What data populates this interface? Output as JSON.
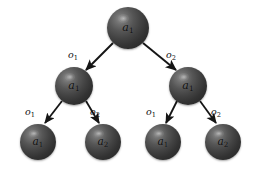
{
  "diagram": {
    "type": "binary-decision-tree",
    "background_color": "#ffffff",
    "node_color": "#3a3a3a",
    "edge_color": "#1a1a1a",
    "label_color": "#111111",
    "levels": 3,
    "nodes": [
      {
        "id": "root",
        "label_main": "a",
        "label_sub": "1",
        "level": 0,
        "cx": 128,
        "cy": 28,
        "r": 21
      },
      {
        "id": "n-l",
        "label_main": "a",
        "label_sub": "1",
        "level": 1,
        "cx": 74,
        "cy": 86,
        "r": 19
      },
      {
        "id": "n-r",
        "label_main": "a",
        "label_sub": "1",
        "level": 1,
        "cx": 188,
        "cy": 86,
        "r": 19
      },
      {
        "id": "leaf-1",
        "label_main": "a",
        "label_sub": "1",
        "level": 2,
        "cx": 38,
        "cy": 142,
        "r": 18
      },
      {
        "id": "leaf-2",
        "label_main": "a",
        "label_sub": "2",
        "level": 2,
        "cx": 103,
        "cy": 142,
        "r": 18
      },
      {
        "id": "leaf-3",
        "label_main": "a",
        "label_sub": "1",
        "level": 2,
        "cx": 163,
        "cy": 142,
        "r": 18
      },
      {
        "id": "leaf-4",
        "label_main": "a",
        "label_sub": "2",
        "level": 2,
        "cx": 223,
        "cy": 142,
        "r": 18
      }
    ],
    "edges": [
      {
        "id": "e-root-l",
        "from": "root",
        "to": "n-l",
        "label_main": "o",
        "label_sub": "1",
        "label_x": 68,
        "label_y": 50
      },
      {
        "id": "e-root-r",
        "from": "root",
        "to": "n-r",
        "label_main": "o",
        "label_sub": "2",
        "label_x": 166,
        "label_y": 50
      },
      {
        "id": "e-l-1",
        "from": "n-l",
        "to": "leaf-1",
        "label_main": "o",
        "label_sub": "1",
        "label_x": 25,
        "label_y": 107
      },
      {
        "id": "e-l-2",
        "from": "n-l",
        "to": "leaf-2",
        "label_main": "o",
        "label_sub": "2",
        "label_x": 90,
        "label_y": 107
      },
      {
        "id": "e-r-1",
        "from": "n-r",
        "to": "leaf-3",
        "label_main": "o",
        "label_sub": "1",
        "label_x": 146,
        "label_y": 107
      },
      {
        "id": "e-r-2",
        "from": "n-r",
        "to": "leaf-4",
        "label_main": "o",
        "label_sub": "2",
        "label_x": 211,
        "label_y": 107
      }
    ]
  }
}
